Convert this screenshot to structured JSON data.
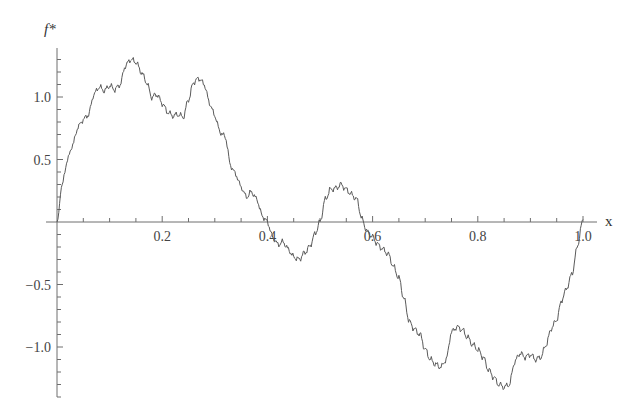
{
  "chart_data": {
    "type": "line",
    "title": "",
    "xlabel": "x",
    "ylabel": "f*",
    "xlim": [
      0,
      1.0
    ],
    "ylim": [
      -1.4,
      1.4
    ],
    "grid": false,
    "legend": null,
    "x_ticks": [
      {
        "value": 0.2,
        "label": "0.2"
      },
      {
        "value": 0.4,
        "label": "0.4"
      },
      {
        "value": 0.6,
        "label": "0.6"
      },
      {
        "value": 0.8,
        "label": "0.8"
      },
      {
        "value": 1.0,
        "label": "1.0"
      }
    ],
    "x_minor_step": 0.05,
    "y_ticks": [
      {
        "value": 1.0,
        "label": "1.0"
      },
      {
        "value": 0.5,
        "label": "0.5"
      },
      {
        "value": -0.5,
        "label": "-0.5"
      },
      {
        "value": -1.0,
        "label": "-1.0"
      }
    ],
    "y_minor_step": 0.1,
    "series": [
      {
        "name": "f*",
        "color": "#5a5a5a",
        "x": [
          0.0,
          0.01,
          0.02,
          0.03,
          0.04,
          0.05,
          0.06,
          0.07,
          0.08,
          0.09,
          0.1,
          0.11,
          0.12,
          0.13,
          0.14,
          0.15,
          0.16,
          0.17,
          0.18,
          0.19,
          0.2,
          0.21,
          0.22,
          0.23,
          0.24,
          0.25,
          0.26,
          0.27,
          0.28,
          0.29,
          0.3,
          0.31,
          0.32,
          0.33,
          0.34,
          0.35,
          0.36,
          0.37,
          0.38,
          0.39,
          0.4,
          0.41,
          0.42,
          0.43,
          0.44,
          0.45,
          0.46,
          0.47,
          0.48,
          0.49,
          0.5,
          0.51,
          0.52,
          0.53,
          0.54,
          0.55,
          0.56,
          0.57,
          0.58,
          0.59,
          0.6,
          0.61,
          0.62,
          0.63,
          0.64,
          0.65,
          0.66,
          0.67,
          0.68,
          0.69,
          0.7,
          0.71,
          0.72,
          0.73,
          0.74,
          0.75,
          0.76,
          0.77,
          0.78,
          0.79,
          0.8,
          0.81,
          0.82,
          0.83,
          0.84,
          0.85,
          0.86,
          0.87,
          0.88,
          0.89,
          0.9,
          0.91,
          0.92,
          0.93,
          0.94,
          0.95,
          0.96,
          0.97,
          0.98,
          0.99,
          1.0
        ],
        "values": [
          0.0,
          0.3,
          0.5,
          0.62,
          0.76,
          0.82,
          0.86,
          1.02,
          1.08,
          1.05,
          1.09,
          1.06,
          1.1,
          1.25,
          1.3,
          1.28,
          1.2,
          1.12,
          1.0,
          1.02,
          0.95,
          0.88,
          0.85,
          0.86,
          0.84,
          0.98,
          1.12,
          1.15,
          1.1,
          0.95,
          0.85,
          0.72,
          0.68,
          0.45,
          0.38,
          0.28,
          0.2,
          0.24,
          0.18,
          0.05,
          0.0,
          -0.12,
          -0.18,
          -0.16,
          -0.22,
          -0.28,
          -0.3,
          -0.25,
          -0.2,
          -0.1,
          0.0,
          0.18,
          0.26,
          0.27,
          0.3,
          0.26,
          0.22,
          0.18,
          0.02,
          -0.08,
          -0.12,
          -0.18,
          -0.22,
          -0.26,
          -0.36,
          -0.45,
          -0.62,
          -0.8,
          -0.86,
          -0.9,
          -1.02,
          -1.1,
          -1.14,
          -1.16,
          -1.1,
          -0.88,
          -0.84,
          -0.86,
          -0.92,
          -0.98,
          -1.02,
          -1.08,
          -1.18,
          -1.24,
          -1.3,
          -1.32,
          -1.3,
          -1.12,
          -1.05,
          -1.08,
          -1.06,
          -1.1,
          -1.08,
          -0.98,
          -0.85,
          -0.78,
          -0.62,
          -0.52,
          -0.4,
          -0.18,
          0.02
        ]
      }
    ]
  }
}
